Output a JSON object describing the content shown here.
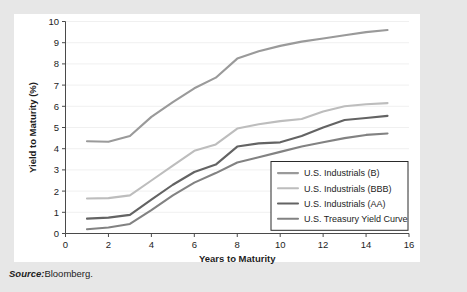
{
  "figure": {
    "top_clipped_text": "",
    "source_label": "Source:",
    "source_value": "Bloomberg."
  },
  "chart_data": {
    "type": "line",
    "title": "",
    "xlabel": "Years to Maturity",
    "ylabel": "Yield to Maturity (%)",
    "xlim": [
      0,
      16
    ],
    "ylim": [
      0,
      10
    ],
    "xticks": [
      0,
      2,
      4,
      6,
      8,
      10,
      12,
      14,
      16
    ],
    "yticks": [
      0,
      1,
      2,
      3,
      4,
      5,
      6,
      7,
      8,
      9,
      10
    ],
    "grid": "horizontal",
    "legend_position": "lower-right-inside",
    "x": [
      1,
      2,
      3,
      4,
      5,
      6,
      7,
      8,
      9,
      10,
      11,
      12,
      13,
      14,
      15
    ],
    "series": [
      {
        "name": "U.S. Industrials (B)",
        "color": "#9a9a9a",
        "values": [
          4.35,
          4.33,
          4.6,
          5.5,
          6.2,
          6.85,
          7.35,
          8.25,
          8.6,
          8.85,
          9.05,
          9.2,
          9.35,
          9.5,
          9.6
        ]
      },
      {
        "name": "U.S. Industrials (BBB)",
        "color": "#bdbdbd",
        "values": [
          1.65,
          1.67,
          1.8,
          2.5,
          3.2,
          3.9,
          4.2,
          4.95,
          5.15,
          5.3,
          5.4,
          5.75,
          6.0,
          6.1,
          6.15
        ]
      },
      {
        "name": "U.S. Industrials (AA)",
        "color": "#636363",
        "values": [
          0.7,
          0.75,
          0.88,
          1.6,
          2.3,
          2.9,
          3.25,
          4.1,
          4.25,
          4.3,
          4.6,
          5.0,
          5.35,
          5.45,
          5.55
        ]
      },
      {
        "name": "U.S. Treasury Yield Curve",
        "color": "#828282",
        "values": [
          0.2,
          0.28,
          0.45,
          1.1,
          1.8,
          2.4,
          2.85,
          3.35,
          3.6,
          3.85,
          4.1,
          4.3,
          4.5,
          4.65,
          4.72
        ]
      }
    ]
  },
  "axis": {
    "x_tick_labels": [
      "0",
      "2",
      "4",
      "6",
      "8",
      "10",
      "12",
      "14",
      "16"
    ],
    "y_tick_labels": [
      "0",
      "1",
      "2",
      "3",
      "4",
      "5",
      "6",
      "7",
      "8",
      "9",
      "10"
    ]
  },
  "legend": {
    "items": [
      {
        "label": "U.S. Industrials (B)"
      },
      {
        "label": "U.S. Industrials (BBB)"
      },
      {
        "label": "U.S. Industrials (AA)"
      },
      {
        "label": "U.S. Treasury Yield Curve"
      }
    ]
  }
}
